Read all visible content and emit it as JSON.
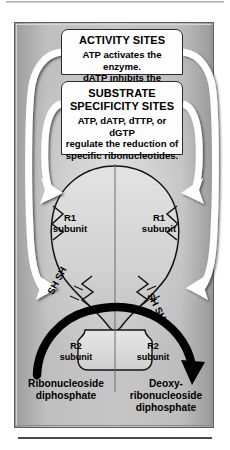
{
  "figure": {
    "name": "ribonucleotide-reductase-regulation-diagram",
    "colors": {
      "frame_fill_light": "#c6c6c6",
      "frame_fill_dark": "#9a9a9a",
      "frame_border": "#5d5d5d",
      "box_fill": "#fdfdfd",
      "box_border": "#2b2b2b",
      "arrow_white": "#ffffff",
      "arrow_black": "#000000",
      "text": "#000000"
    },
    "activity_sites": {
      "title": "ACTIVITY SITES",
      "line1": "ATP activates the enzyme.",
      "line2": "dATP inhibits the enzyme."
    },
    "substrate_specificity_sites": {
      "title_line1": "SUBSTRATE",
      "title_line2": "SPECIFICITY SITES",
      "body_line1": "ATP, dATP, dTTP, or dGTP",
      "body_line2": "regulate the reduction of",
      "body_line3": "specific ribonucleotides."
    },
    "subunits": {
      "r1_left": {
        "line1": "R1",
        "line2": "subunit"
      },
      "r1_right": {
        "line1": "R1",
        "line2": "subunit"
      },
      "r2_left": {
        "line1": "R2",
        "line2": "subunit"
      },
      "r2_right": {
        "line1": "R2",
        "line2": "subunit"
      }
    },
    "thiol_labels": {
      "left": "SH SH",
      "right": "SH SH"
    },
    "reaction": {
      "substrate_line1": "Ribonucleoside",
      "substrate_line2": "diphosphate",
      "product_line1": "Deoxy-",
      "product_line2": "ribonucleoside",
      "product_line3": "diphosphate"
    },
    "arrows": {
      "white_outer_count": 2,
      "white_inner_count": 2,
      "black_reaction_arrow": "substrate-to-product"
    }
  }
}
